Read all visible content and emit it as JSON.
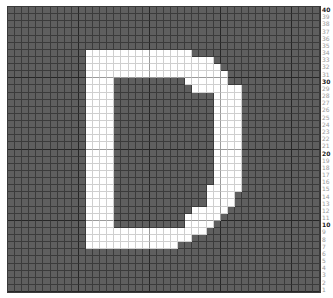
{
  "grid": {
    "columns": 44,
    "rows": 40,
    "major_every": 10,
    "colors": {
      "off": "#5f5f5f",
      "on": "#ffffff",
      "grid_line": "#3b3b3b",
      "major_line": "#262626",
      "label": "#9a9a9a",
      "label_major": "#222222"
    },
    "letter": "D",
    "filled_rows": {
      "6": [
        [
          11,
          25
        ]
      ],
      "7": [
        [
          11,
          28
        ]
      ],
      "8": [
        [
          11,
          29
        ]
      ],
      "9": [
        [
          11,
          30
        ]
      ],
      "10": [
        [
          11,
          14
        ],
        [
          25,
          30
        ]
      ],
      "11": [
        [
          11,
          14
        ],
        [
          26,
          32
        ]
      ],
      "12": [
        [
          11,
          14
        ],
        [
          29,
          32
        ]
      ],
      "13": [
        [
          11,
          14
        ],
        [
          29,
          32
        ]
      ],
      "14": [
        [
          11,
          14
        ],
        [
          29,
          32
        ]
      ],
      "15": [
        [
          11,
          14
        ],
        [
          29,
          32
        ]
      ],
      "16": [
        [
          11,
          14
        ],
        [
          29,
          32
        ]
      ],
      "17": [
        [
          11,
          14
        ],
        [
          29,
          32
        ]
      ],
      "18": [
        [
          11,
          14
        ],
        [
          29,
          32
        ]
      ],
      "19": [
        [
          11,
          14
        ],
        [
          29,
          32
        ]
      ],
      "20": [
        [
          11,
          14
        ],
        [
          29,
          32
        ]
      ],
      "21": [
        [
          11,
          14
        ],
        [
          29,
          32
        ]
      ],
      "22": [
        [
          11,
          14
        ],
        [
          29,
          32
        ]
      ],
      "23": [
        [
          11,
          14
        ],
        [
          29,
          32
        ]
      ],
      "24": [
        [
          11,
          14
        ],
        [
          29,
          32
        ]
      ],
      "25": [
        [
          11,
          14
        ],
        [
          28,
          32
        ]
      ],
      "26": [
        [
          11,
          14
        ],
        [
          28,
          31
        ]
      ],
      "27": [
        [
          11,
          14
        ],
        [
          28,
          31
        ]
      ],
      "28": [
        [
          11,
          14
        ],
        [
          26,
          30
        ]
      ],
      "29": [
        [
          11,
          14
        ],
        [
          25,
          29
        ]
      ],
      "30": [
        [
          11,
          14
        ],
        [
          25,
          28
        ]
      ],
      "31": [
        [
          11,
          27
        ]
      ],
      "32": [
        [
          11,
          25
        ]
      ],
      "33": [
        [
          11,
          23
        ]
      ]
    }
  },
  "row_labels": [
    "40",
    "39",
    "38",
    "37",
    "36",
    "35",
    "34",
    "33",
    "32",
    "31",
    "30",
    "29",
    "28",
    "27",
    "26",
    "25",
    "24",
    "23",
    "22",
    "21",
    "20",
    "19",
    "18",
    "17",
    "16",
    "15",
    "14",
    "13",
    "12",
    "11",
    "10",
    "9",
    "8",
    "7",
    "6",
    "5",
    "4",
    "3",
    "2",
    "1"
  ],
  "major_labels": [
    "40",
    "30",
    "20",
    "10"
  ]
}
